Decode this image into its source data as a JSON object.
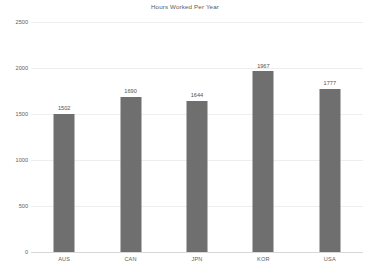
{
  "chart_data": {
    "type": "bar",
    "title": "Hours Worked Per Year",
    "xlabel": "",
    "ylabel": "",
    "categories": [
      "AUS",
      "CAN",
      "JPN",
      "KOR",
      "USA"
    ],
    "values": [
      1502,
      1690,
      1644,
      1967,
      1777
    ],
    "value_labels": [
      "1502",
      "1690",
      "1644",
      "1967",
      "1777"
    ],
    "ylim": [
      0,
      2500
    ],
    "yticks": [
      0,
      500,
      1000,
      1500,
      2000,
      2500
    ],
    "ytick_labels": [
      "0",
      "500",
      "1000",
      "1500",
      "2000",
      "2500"
    ],
    "grid": true,
    "legend": false,
    "legend_position": "none",
    "series": [
      {
        "name": "Hours Worked Per Year",
        "values": [
          1502,
          1690,
          1644,
          1967,
          1777
        ],
        "color": "#6f6f6f"
      }
    ],
    "colors": {
      "bar": "#6f6f6f",
      "grid": "#eeeeee",
      "axis": "#d8d8d8",
      "text": "#5e5e5e",
      "title": "#5a5a5a",
      "background": "#ffffff"
    }
  }
}
